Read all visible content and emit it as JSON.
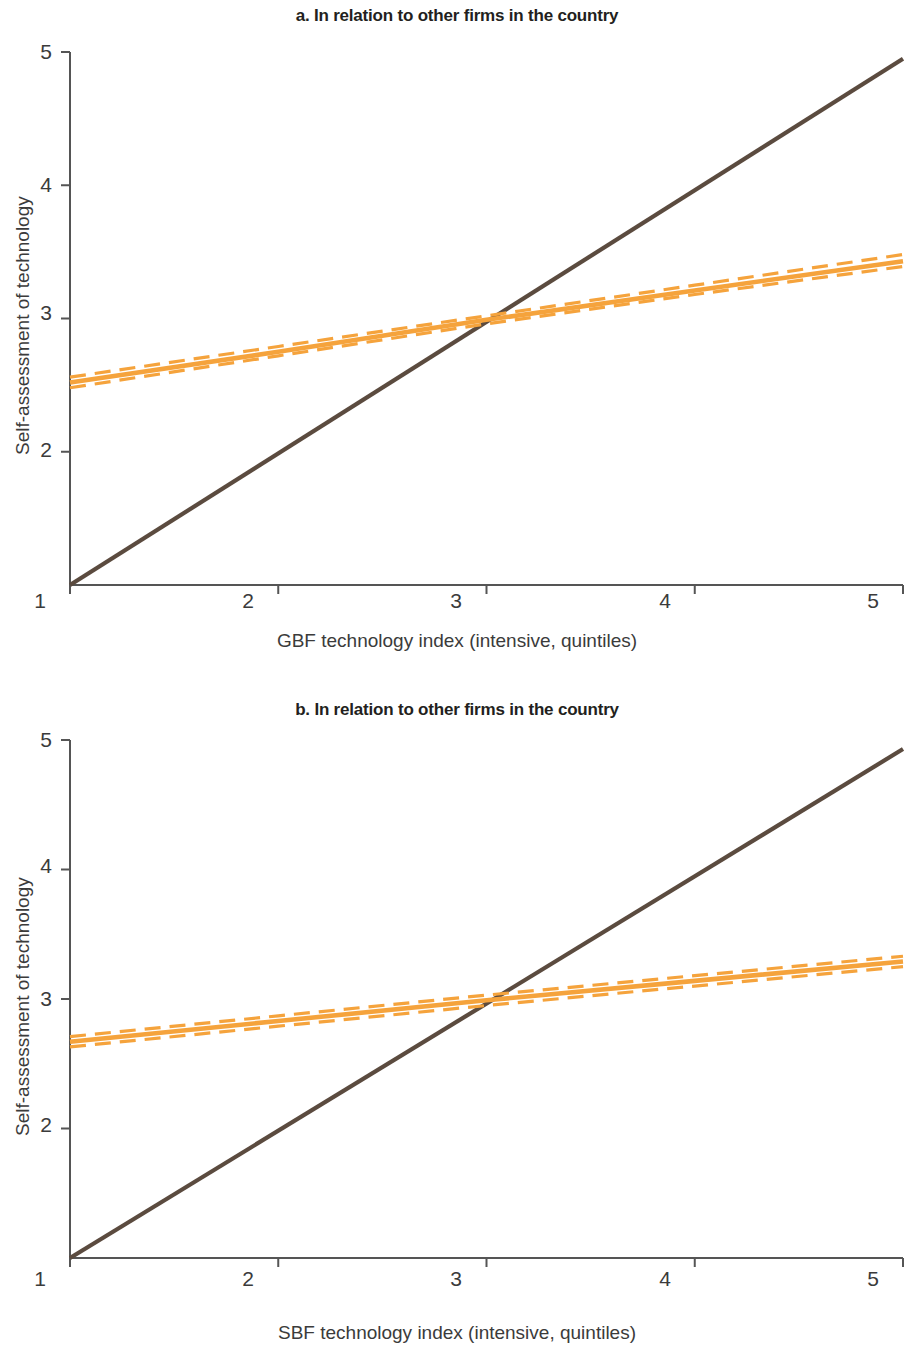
{
  "figure": {
    "background_color": "#ffffff",
    "line_color_fit": "#F5A33C",
    "line_color_reference": "#5B4B3F",
    "axis_color": "#555555",
    "text_color": "#3b3b3b"
  },
  "panels": [
    {
      "id": "a",
      "title": "a. In relation to other firms in the country",
      "xlabel": "GBF technology index (intensive, quintiles)",
      "ylabel": "Self-assessment of technology",
      "xticks": [
        "1",
        "2",
        "3",
        "4",
        "5"
      ],
      "yticks": [
        "2",
        "3",
        "4",
        "5"
      ]
    },
    {
      "id": "b",
      "title": "b. In relation to other firms in the country",
      "xlabel": "SBF technology index (intensive, quintiles)",
      "ylabel": "Self-assessment of technology",
      "xticks": [
        "1",
        "2",
        "3",
        "4",
        "5"
      ],
      "yticks": [
        "2",
        "3",
        "4",
        "5"
      ]
    }
  ],
  "chart_data": [
    {
      "type": "line",
      "panel": "a",
      "title": "a. In relation to other firms in the country",
      "xlabel": "GBF technology index (intensive, quintiles)",
      "ylabel": "Self-assessment of technology",
      "xlim": [
        1,
        5
      ],
      "ylim": [
        1,
        5
      ],
      "xticks": [
        1,
        2,
        3,
        4,
        5
      ],
      "yticks": [
        2,
        3,
        4,
        5
      ],
      "grid": false,
      "legend": "none",
      "series": [
        {
          "name": "45-degree reference line",
          "style": "solid",
          "color": "#5B4B3F",
          "x": [
            1,
            5
          ],
          "values": [
            1.0,
            4.95
          ]
        },
        {
          "name": "Fitted self-assessment",
          "style": "solid",
          "color": "#F5A33C",
          "x": [
            1,
            2,
            3,
            4,
            5
          ],
          "values": [
            2.52,
            2.75,
            2.99,
            3.21,
            3.43
          ]
        },
        {
          "name": "Upper confidence bound",
          "style": "dashed",
          "color": "#F5A33C",
          "x": [
            1,
            2,
            3,
            4,
            5
          ],
          "values": [
            2.56,
            2.79,
            3.02,
            3.25,
            3.48
          ]
        },
        {
          "name": "Lower confidence bound",
          "style": "dashed",
          "color": "#F5A33C",
          "x": [
            1,
            2,
            3,
            4,
            5
          ],
          "values": [
            2.48,
            2.72,
            2.96,
            3.18,
            3.39
          ]
        }
      ],
      "annotations": [
        {
          "label": "lines cross",
          "x": 3.1,
          "y": 3.05
        }
      ]
    },
    {
      "type": "line",
      "panel": "b",
      "title": "b. In relation to other firms in the country",
      "xlabel": "SBF technology index (intensive, quintiles)",
      "ylabel": "Self-assessment of technology",
      "xlim": [
        1,
        5
      ],
      "ylim": [
        1,
        5
      ],
      "xticks": [
        1,
        2,
        3,
        4,
        5
      ],
      "yticks": [
        2,
        3,
        4,
        5
      ],
      "grid": false,
      "legend": "none",
      "series": [
        {
          "name": "45-degree reference line",
          "style": "solid",
          "color": "#5B4B3F",
          "x": [
            1,
            5
          ],
          "values": [
            1.0,
            4.93
          ]
        },
        {
          "name": "Fitted self-assessment",
          "style": "solid",
          "color": "#F5A33C",
          "x": [
            1,
            2,
            3,
            4,
            5
          ],
          "values": [
            2.67,
            2.83,
            2.99,
            3.14,
            3.29
          ]
        },
        {
          "name": "Upper confidence bound",
          "style": "dashed",
          "color": "#F5A33C",
          "x": [
            1,
            2,
            3,
            4,
            5
          ],
          "values": [
            2.71,
            2.87,
            3.03,
            3.18,
            3.33
          ]
        },
        {
          "name": "Lower confidence bound",
          "style": "dashed",
          "color": "#F5A33C",
          "x": [
            1,
            2,
            3,
            4,
            5
          ],
          "values": [
            2.63,
            2.79,
            2.95,
            3.1,
            3.25
          ]
        }
      ],
      "annotations": [
        {
          "label": "lines cross",
          "x": 3.0,
          "y": 3.0
        }
      ]
    }
  ]
}
